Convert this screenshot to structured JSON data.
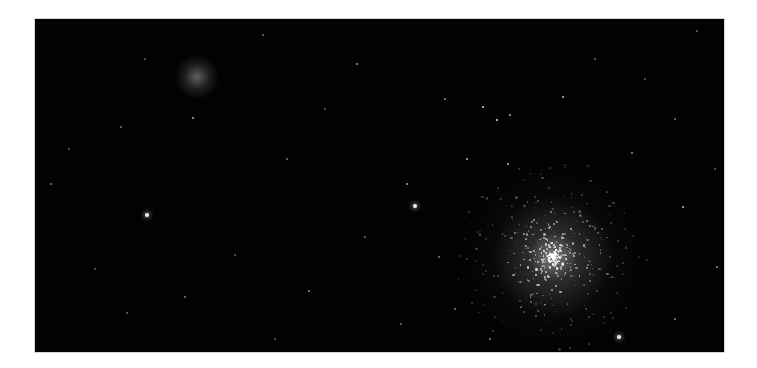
{
  "image": {
    "subject": "star field with two globular clusters",
    "background_color": "#020202",
    "frame": {
      "left": 35,
      "top": 19,
      "width": 689,
      "height": 333
    }
  },
  "objects": {
    "faint_cluster": {
      "x": 162,
      "y": 58,
      "radius": 22,
      "color": "#9a9a9a"
    },
    "bright_cluster": {
      "x": 518,
      "y": 238,
      "radius": 95,
      "core_radius": 28,
      "color": "#e8e8e8"
    }
  },
  "stars": [
    {
      "x": 380,
      "y": 187,
      "r": 2.4,
      "a": 0.95
    },
    {
      "x": 112,
      "y": 196,
      "r": 2.2,
      "a": 0.95
    },
    {
      "x": 372,
      "y": 165,
      "r": 1.2,
      "a": 0.7
    },
    {
      "x": 448,
      "y": 88,
      "r": 1.4,
      "a": 0.85
    },
    {
      "x": 462,
      "y": 101,
      "r": 1.4,
      "a": 0.85
    },
    {
      "x": 475,
      "y": 96,
      "r": 1.1,
      "a": 0.7
    },
    {
      "x": 528,
      "y": 78,
      "r": 1.2,
      "a": 0.75
    },
    {
      "x": 432,
      "y": 140,
      "r": 1.1,
      "a": 0.7
    },
    {
      "x": 473,
      "y": 145,
      "r": 1.1,
      "a": 0.7
    },
    {
      "x": 410,
      "y": 80,
      "r": 1.0,
      "a": 0.6
    },
    {
      "x": 322,
      "y": 45,
      "r": 1.1,
      "a": 0.6
    },
    {
      "x": 158,
      "y": 99,
      "r": 1.1,
      "a": 0.7
    },
    {
      "x": 16,
      "y": 165,
      "r": 1.0,
      "a": 0.5
    },
    {
      "x": 86,
      "y": 108,
      "r": 0.9,
      "a": 0.45
    },
    {
      "x": 34,
      "y": 130,
      "r": 0.9,
      "a": 0.4
    },
    {
      "x": 274,
      "y": 272,
      "r": 1.0,
      "a": 0.6
    },
    {
      "x": 150,
      "y": 278,
      "r": 0.9,
      "a": 0.5
    },
    {
      "x": 92,
      "y": 294,
      "r": 0.9,
      "a": 0.4
    },
    {
      "x": 648,
      "y": 188,
      "r": 1.3,
      "a": 0.75
    },
    {
      "x": 682,
      "y": 248,
      "r": 1.0,
      "a": 0.6
    },
    {
      "x": 584,
      "y": 318,
      "r": 1.8,
      "a": 0.9
    },
    {
      "x": 597,
      "y": 134,
      "r": 1.0,
      "a": 0.55
    },
    {
      "x": 640,
      "y": 100,
      "r": 0.9,
      "a": 0.45
    },
    {
      "x": 662,
      "y": 12,
      "r": 0.9,
      "a": 0.4
    },
    {
      "x": 228,
      "y": 16,
      "r": 0.8,
      "a": 0.4
    },
    {
      "x": 252,
      "y": 140,
      "r": 0.8,
      "a": 0.4
    },
    {
      "x": 330,
      "y": 218,
      "r": 0.9,
      "a": 0.45
    },
    {
      "x": 404,
      "y": 238,
      "r": 0.9,
      "a": 0.5
    },
    {
      "x": 366,
      "y": 305,
      "r": 0.8,
      "a": 0.4
    },
    {
      "x": 200,
      "y": 236,
      "r": 0.8,
      "a": 0.35
    },
    {
      "x": 60,
      "y": 250,
      "r": 0.8,
      "a": 0.35
    },
    {
      "x": 290,
      "y": 90,
      "r": 0.8,
      "a": 0.35
    },
    {
      "x": 560,
      "y": 40,
      "r": 0.8,
      "a": 0.4
    },
    {
      "x": 610,
      "y": 60,
      "r": 0.8,
      "a": 0.35
    },
    {
      "x": 680,
      "y": 150,
      "r": 0.8,
      "a": 0.35
    },
    {
      "x": 420,
      "y": 290,
      "r": 0.9,
      "a": 0.5
    },
    {
      "x": 455,
      "y": 320,
      "r": 0.9,
      "a": 0.5
    },
    {
      "x": 640,
      "y": 300,
      "r": 0.9,
      "a": 0.5
    },
    {
      "x": 110,
      "y": 40,
      "r": 0.8,
      "a": 0.35
    },
    {
      "x": 240,
      "y": 320,
      "r": 0.8,
      "a": 0.35
    }
  ],
  "cluster_members": {
    "count": 520,
    "seed": 7
  }
}
